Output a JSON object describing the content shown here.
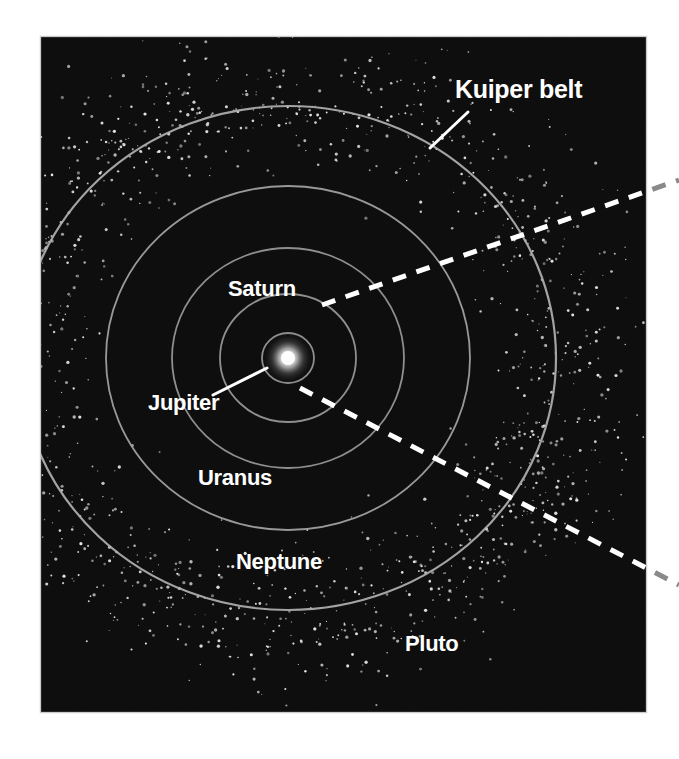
{
  "figure": {
    "name": "outer-solar-system-kuiper-belt-diagram",
    "background_color": "#ffffff",
    "panel": {
      "x": 41,
      "y": 37,
      "width": 605,
      "height": 675,
      "fill_color": "#0d0d0d",
      "edge_highlight_color": "#b9b9b9"
    },
    "media": "scanned halftone print, monochrome"
  },
  "labels": {
    "kuiper_belt": "Kuiper belt",
    "saturn": "Saturn",
    "jupiter": "Jupiter",
    "uranus": "Uranus",
    "neptune": "Neptune",
    "pluto": "Pluto"
  },
  "chart_data": {
    "type": "scatter",
    "subtitle": "",
    "xlabel": "",
    "ylabel": "",
    "projection": "plan view (looking down on the ecliptic plane)",
    "grid": false,
    "legend": "none (direct labels)",
    "center": {
      "name": "Sun",
      "x": 288,
      "y": 358,
      "glow_radius": 26,
      "core_radius": 7,
      "color": "#ffffff"
    },
    "orbits": [
      {
        "name": "Jupiter",
        "rx": 26,
        "ry": 25,
        "stroke": "#9a9a9a",
        "label": "Jupiter"
      },
      {
        "name": "Saturn",
        "rx": 68,
        "ry": 64,
        "stroke": "#9a9a9a",
        "label": "Saturn"
      },
      {
        "name": "Uranus",
        "rx": 116,
        "ry": 110,
        "stroke": "#9a9a9a",
        "label": "Uranus"
      },
      {
        "name": "Neptune",
        "rx": 182,
        "ry": 172,
        "stroke": "#a5a5a5",
        "label": "Neptune"
      },
      {
        "name": "Pluto",
        "rx": 268,
        "ry": 252,
        "stroke": "#b0b0b0",
        "label": "Pluto"
      }
    ],
    "kuiper_belt": {
      "description": "dense annulus of small white dots representing Kuiper belt objects",
      "inner_radius_x": 235,
      "outer_radius_x": 330,
      "point_count": 1400,
      "point_color": "#e8e8e8",
      "point_size_range": [
        1,
        3.4
      ]
    },
    "annotations": [
      {
        "name": "kuiper-belt-callout",
        "text": "Kuiper belt",
        "text_x": 455,
        "text_y": 98,
        "leader": {
          "x1": 468,
          "y1": 112,
          "x2": 430,
          "y2": 148
        },
        "color": "#ffffff"
      },
      {
        "name": "jupiter-leader",
        "text": "Jupiter",
        "text_x": 148,
        "text_y": 410,
        "leader": {
          "x1": 213,
          "y1": 395,
          "x2": 267,
          "y2": 368
        },
        "color": "#ffffff"
      },
      {
        "name": "saturn-label",
        "text": "Saturn",
        "text_x": 228,
        "text_y": 296,
        "color": "#ffffff"
      },
      {
        "name": "uranus-label",
        "text": "Uranus",
        "text_x": 198,
        "text_y": 485,
        "color": "#ffffff"
      },
      {
        "name": "neptune-label",
        "text": "Neptune",
        "text_x": 236,
        "text_y": 569,
        "color": "#ffffff"
      },
      {
        "name": "pluto-label",
        "text": "Pluto",
        "text_x": 405,
        "text_y": 651,
        "color": "#ffffff"
      }
    ],
    "dashed_lines": [
      {
        "name": "upper-zoom-guide",
        "x1": 322,
        "y1": 305,
        "x2": 679,
        "y2": 180,
        "panel_exit_x": 646,
        "dash": "14 11",
        "color_inside_panel": "#ffffff",
        "color_outside_panel": "#8a8a8a",
        "width": 5
      },
      {
        "name": "lower-zoom-guide",
        "x1": 300,
        "y1": 388,
        "x2": 679,
        "y2": 585,
        "panel_exit_x": 646,
        "dash": "14 11",
        "color_inside_panel": "#ffffff",
        "color_outside_panel": "#8a8a8a",
        "width": 5
      }
    ]
  }
}
